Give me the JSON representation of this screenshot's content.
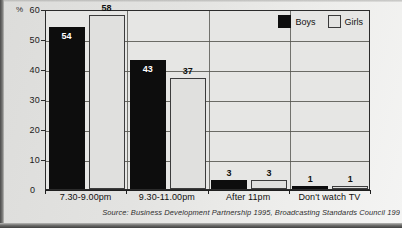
{
  "chart_data": {
    "type": "bar",
    "title": "",
    "xlabel": "",
    "ylabel": "%",
    "ylim": [
      0,
      60
    ],
    "yticks": [
      0,
      10,
      20,
      30,
      40,
      50,
      60
    ],
    "grid": true,
    "legend_position": "top-right",
    "categories": [
      "7.30-9.00pm",
      "9.30-11.00pm",
      "After 11pm",
      "Don't watch TV"
    ],
    "series": [
      {
        "name": "Boys",
        "color": "#0d0d0d",
        "values": [
          54,
          43,
          3,
          1
        ]
      },
      {
        "name": "Girls",
        "color": "#e0e0de",
        "values": [
          58,
          37,
          3,
          1
        ]
      }
    ],
    "source_note": "Source: Business Development Partnership 1995, Broadcasting Standards Council 199",
    "zero_label": "0"
  }
}
